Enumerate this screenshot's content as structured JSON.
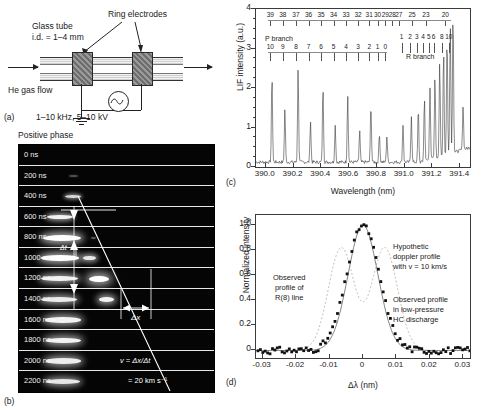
{
  "panel_a": {
    "tag": "(a)",
    "labels": {
      "glass_tube": "Glass tube",
      "tube_id": "i.d. = 1–4 mm",
      "ring_electrodes": "Ring electrodes",
      "gas_flow": "He gas flow",
      "params": "1–10 kHz, 5–10 kV"
    }
  },
  "panel_b": {
    "tag": "(b)",
    "title": "Positive phase",
    "frames": [
      {
        "time": "0 ns",
        "left": null,
        "right": null
      },
      {
        "time": "200 ns",
        "left": null,
        "right": {
          "x": 50,
          "w": 9,
          "h": 2.0,
          "o": 0.3
        }
      },
      {
        "time": "400 ns",
        "left": null,
        "right": {
          "x": 46,
          "w": 16,
          "h": 3.0,
          "o": 0.85
        }
      },
      {
        "time": "600 ns",
        "left": {
          "x": 28,
          "w": 26,
          "h": 4.0,
          "o": 0.95
        },
        "right": null
      },
      {
        "time": "800 ns",
        "left": {
          "x": 24,
          "w": 38,
          "h": 6.0,
          "o": 1.0
        },
        "right": {
          "x": 72,
          "w": 5,
          "h": 2.0,
          "o": 0.35
        }
      },
      {
        "time": "1000 ns",
        "left": {
          "x": 22,
          "w": 38,
          "h": 5.5,
          "o": 1.0
        },
        "right": {
          "x": 64,
          "w": 13,
          "h": 4.5,
          "o": 0.9
        }
      },
      {
        "time": "1200 ns",
        "left": {
          "x": 22,
          "w": 37,
          "h": 5.0,
          "o": 0.95
        },
        "right": {
          "x": 70,
          "w": 20,
          "h": 6.5,
          "o": 1.0
        }
      },
      {
        "time": "1400 ns",
        "left": {
          "x": 22,
          "w": 36,
          "h": 5.0,
          "o": 0.92
        },
        "right": {
          "x": 80,
          "w": 15,
          "h": 5.0,
          "o": 0.95
        }
      },
      {
        "time": "1600 ns",
        "left": {
          "x": 26,
          "w": 36,
          "h": 5.5,
          "o": 0.95
        },
        "right": null
      },
      {
        "time": "1800 ns",
        "left": {
          "x": 27,
          "w": 35,
          "h": 5.5,
          "o": 0.95
        },
        "right": null
      },
      {
        "time": "2000 ns",
        "left": {
          "x": 27,
          "w": 35,
          "h": 5.5,
          "o": 0.93
        },
        "right": null
      },
      {
        "time": "2200 ns",
        "left": {
          "x": 27,
          "w": 34,
          "h": 5.0,
          "o": 0.9
        },
        "right": null
      }
    ],
    "annotations": {
      "delta_t": "Δt",
      "delta_x": "Δx",
      "velocity_formula": "v = Δx/Δt",
      "velocity_value": "= 20 km s⁻¹"
    }
  },
  "panel_c": {
    "tag": "(c)",
    "branch_labels": {
      "p": "P branch",
      "r": "R branch"
    },
    "chart_data": {
      "type": "line",
      "title": "",
      "xlabel": "Wavelength (nm)",
      "ylabel": "LIF intensity (a.u.)",
      "xlim": [
        389.93,
        391.47
      ],
      "ylim": [
        0,
        4
      ],
      "xticks": [
        "390.0",
        "390.2",
        "390.4",
        "390.6",
        "390.8",
        "391.0",
        "391.2",
        "391.4"
      ],
      "xtick_values": [
        390.0,
        390.2,
        390.4,
        390.6,
        390.8,
        391.0,
        391.2,
        391.4
      ],
      "yticks": [
        "0",
        "1",
        "2",
        "3",
        "4"
      ],
      "ytick_values": [
        0,
        1,
        2,
        3,
        4
      ],
      "grid": false,
      "legend": "none",
      "p_branch_upper_labels": [
        "39",
        "38",
        "37",
        "36",
        "35",
        "34",
        "33",
        "32",
        "31",
        "30",
        "29",
        "28",
        "27",
        "25",
        "23",
        "20"
      ],
      "p_branch_upper_x": [
        390.04,
        390.13,
        390.225,
        390.315,
        390.405,
        390.495,
        390.585,
        390.672,
        390.752,
        390.812,
        390.868,
        390.918,
        390.965,
        391.06,
        391.16,
        391.3
      ],
      "p_branch_lower_labels": [
        "10",
        "9",
        "8",
        "7",
        "6",
        "5",
        "4",
        "3",
        "2",
        "1",
        "0"
      ],
      "p_branch_lower_x": [
        390.04,
        390.13,
        390.225,
        390.315,
        390.405,
        390.495,
        390.585,
        390.672,
        390.752,
        390.812,
        390.868
      ],
      "r_branch_labels": [
        "1",
        "2",
        "3",
        "4",
        "5",
        "6",
        "8",
        "10"
      ],
      "r_branch_x": [
        390.985,
        391.045,
        391.095,
        391.14,
        391.18,
        391.215,
        391.275,
        391.325
      ],
      "peaks": [
        {
          "x": 390.045,
          "y": 2.22
        },
        {
          "x": 390.138,
          "y": 1.34
        },
        {
          "x": 390.233,
          "y": 2.35
        },
        {
          "x": 390.322,
          "y": 1.05
        },
        {
          "x": 390.412,
          "y": 1.95
        },
        {
          "x": 390.5,
          "y": 0.92
        },
        {
          "x": 390.59,
          "y": 1.7
        },
        {
          "x": 390.676,
          "y": 0.8
        },
        {
          "x": 390.757,
          "y": 1.5
        },
        {
          "x": 390.818,
          "y": 0.74
        },
        {
          "x": 390.872,
          "y": 0.66
        },
        {
          "x": 390.988,
          "y": 0.95
        },
        {
          "x": 391.048,
          "y": 1.18
        },
        {
          "x": 391.098,
          "y": 1.38
        },
        {
          "x": 391.142,
          "y": 1.6
        },
        {
          "x": 391.182,
          "y": 1.85
        },
        {
          "x": 391.218,
          "y": 2.1
        },
        {
          "x": 391.252,
          "y": 2.4
        },
        {
          "x": 391.28,
          "y": 2.7
        },
        {
          "x": 391.305,
          "y": 3.0
        },
        {
          "x": 391.328,
          "y": 3.3
        },
        {
          "x": 391.348,
          "y": 3.58
        },
        {
          "x": 391.42,
          "y": 1.1
        }
      ],
      "baseline_noise": 0.12
    }
  },
  "panel_d": {
    "tag": "(d)",
    "chart_data": {
      "type": "scatter",
      "title": "",
      "xlabel": "Δλ (nm)",
      "ylabel": "Normalized intensity",
      "xlim": [
        -0.032,
        0.032
      ],
      "ylim": [
        -0.06,
        1.08
      ],
      "xticks": [
        "-0.03",
        "-0.02",
        "-0.01",
        "0",
        "0.01",
        "0.02",
        "0.03"
      ],
      "xtick_values": [
        -0.03,
        -0.02,
        -0.01,
        0,
        0.01,
        0.02,
        0.03
      ],
      "yticks": [
        "0",
        "0.2",
        "0.4",
        "0.6",
        "0.8",
        "1.0"
      ],
      "ytick_values": [
        0,
        0.2,
        0.4,
        0.6,
        0.8,
        1.0
      ],
      "grid": false,
      "legend": "none",
      "series": [
        {
          "name": "Observed profile of R(8) line",
          "style": "filled-square-markers",
          "center": 0.0,
          "peak": 1.0,
          "fwhm": 0.0115
        },
        {
          "name": "Observed profile in low-pressure HC discharge",
          "style": "solid-line",
          "center": 0.0,
          "peak": 1.0,
          "fwhm": 0.0105
        },
        {
          "name": "Hypothetic doppler profile with v = 10 km/s",
          "style": "dotted-line",
          "center": 0.0,
          "peak": 0.82,
          "split": 0.013,
          "fwhm": 0.009
        }
      ]
    },
    "annotations": {
      "obs_r8": [
        "Observed",
        "profile of",
        "R(8) line"
      ],
      "hypothetic": [
        "Hypothetic",
        "doppler profile",
        "with v = 10 km/s"
      ],
      "low_pressure": [
        "Observed profile",
        "in low-pressure",
        "HC discharge"
      ]
    }
  }
}
